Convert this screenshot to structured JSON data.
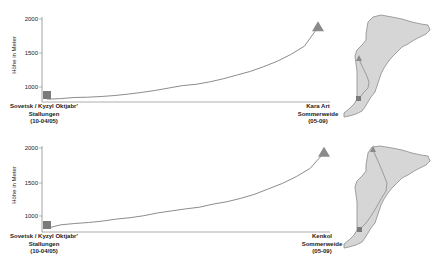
{
  "colors": {
    "axis": "#8a8a8a",
    "line": "#8c8c8c",
    "start_marker": "#7a7a7a",
    "end_marker": "#8a8a8a",
    "map_fill": "#d6d6d6",
    "map_stroke": "#8c8c8c",
    "route": "#8c8c8c"
  },
  "chart_data": [
    {
      "type": "line",
      "title": "",
      "xlabel": "",
      "ylabel": "Höhe in Meter",
      "yticks": [
        1000,
        1500,
        2000
      ],
      "ylim": [
        800,
        2000
      ],
      "grid": false,
      "legend": "none",
      "x": [
        0,
        0.05,
        0.1,
        0.15,
        0.2,
        0.25,
        0.3,
        0.35,
        0.4,
        0.45,
        0.5,
        0.55,
        0.6,
        0.65,
        0.7,
        0.75,
        0.8,
        0.85,
        0.9,
        0.95,
        1.0
      ],
      "series": [
        {
          "name": "Höhenprofil",
          "values": [
            820,
            830,
            845,
            850,
            860,
            875,
            895,
            920,
            950,
            985,
            1020,
            1040,
            1075,
            1120,
            1175,
            1230,
            1300,
            1380,
            1480,
            1600,
            1880
          ]
        }
      ],
      "start": {
        "label_lines": [
          "Sovetsk / Kyzyl Oktjabr'",
          "Stallungen",
          "(10-04/05)"
        ],
        "marker": "square",
        "elevation": 820
      },
      "end": {
        "label_lines": [
          "Kara Art",
          "Sommerweide",
          "(05-09)"
        ],
        "marker": "triangle",
        "elevation": 1880
      }
    },
    {
      "type": "line",
      "title": "",
      "xlabel": "",
      "ylabel": "Höhe in Meter",
      "yticks": [
        1000,
        1500,
        2000
      ],
      "ylim": [
        800,
        2000
      ],
      "grid": false,
      "legend": "none",
      "x": [
        0,
        0.05,
        0.1,
        0.15,
        0.2,
        0.25,
        0.3,
        0.35,
        0.4,
        0.45,
        0.5,
        0.55,
        0.6,
        0.65,
        0.7,
        0.75,
        0.8,
        0.85,
        0.9,
        0.95,
        1.0
      ],
      "series": [
        {
          "name": "Höhenprofil",
          "values": [
            820,
            870,
            890,
            905,
            925,
            955,
            975,
            1005,
            1045,
            1075,
            1105,
            1130,
            1175,
            1210,
            1260,
            1320,
            1400,
            1480,
            1580,
            1700,
            1930
          ]
        }
      ],
      "start": {
        "label_lines": [
          "Sovetsk / Kyzyl Oktjabr'",
          "Stallungen",
          "(10-04/05)"
        ],
        "marker": "square",
        "elevation": 820
      },
      "end": {
        "label_lines": [
          "Kenkol",
          "Sommerweide",
          "(05-09)"
        ],
        "marker": "triangle",
        "elevation": 1930
      }
    }
  ],
  "panels": [
    {
      "ylabel": "Höhe in Meter",
      "ticks": [
        "2000",
        "1500",
        "1000"
      ],
      "start": {
        "l1": "Sovetsk / Kyzyl Oktjabr'",
        "l2": "Stallungen",
        "l3": "(10-04/05)"
      },
      "end": {
        "l1": "Kara Art",
        "l2": "Sommerweide",
        "l3": "(05-09)"
      }
    },
    {
      "ylabel": "Höhe in Meter",
      "ticks": [
        "2000",
        "1500",
        "1000"
      ],
      "start": {
        "l1": "Sovetsk / Kyzyl Oktjabr'",
        "l2": "Stallungen",
        "l3": "(10-04/05)"
      },
      "end": {
        "l1": "Kenkol",
        "l2": "Sommerweide",
        "l3": "(05-09)"
      }
    }
  ]
}
